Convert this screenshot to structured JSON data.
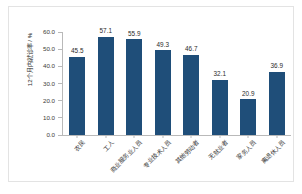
{
  "chart_data": {
    "type": "bar",
    "title": "",
    "subtitle": "",
    "xlabel": "",
    "ylabel": "12个月内就诊率 / %",
    "ylim": [
      0.0,
      60.0
    ],
    "ytick_step": 10.0,
    "ytick_labels": [
      "60.0",
      "50.0",
      "40.0",
      "30.0",
      "20.0",
      "10.0",
      "0.0"
    ],
    "ytick_values": [
      60.0,
      50.0,
      40.0,
      30.0,
      20.0,
      10.0,
      0.0
    ],
    "grid": false,
    "legend": false,
    "legend_position": "none",
    "bar_color": "#1f4e79",
    "categories": [
      "农民",
      "工人",
      "商业服务业人员",
      "专业技术人员",
      "其他劳动者",
      "无就业者",
      "家务人员",
      "离退休人员"
    ],
    "values": [
      45.5,
      57.1,
      55.9,
      49.3,
      46.7,
      32.1,
      20.9,
      36.9
    ],
    "value_labels": [
      "45.5",
      "57.1",
      "55.9",
      "49.3",
      "46.7",
      "32.1",
      "20.9",
      "36.9"
    ],
    "series": [
      {
        "name": "12个月内就诊率",
        "values": [
          45.5,
          57.1,
          55.9,
          49.3,
          46.7,
          32.1,
          20.9,
          36.9
        ]
      }
    ]
  },
  "colors": {
    "bar": "#1f4e79",
    "axis": "#b9b9b9",
    "text": "#2b2b2b",
    "frame": "#e3e3e3",
    "background": "#ffffff"
  }
}
